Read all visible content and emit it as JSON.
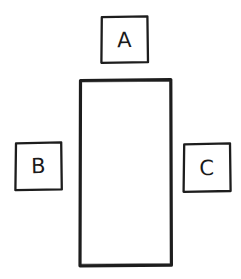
{
  "diagram": {
    "style": "hand-drawn-sketch",
    "background_color": "#ffffff",
    "ink_color": "#1a1a1a",
    "canvas": {
      "width": 241,
      "height": 279
    },
    "shapes": [
      {
        "id": "main-container",
        "name": "main-rectangle",
        "label": "",
        "kind": "rectangle",
        "x": 79,
        "y": 79,
        "width": 93,
        "height": 187,
        "stroke_width": 3,
        "fill": "#ffffff",
        "stroke": "#1a1a1a"
      },
      {
        "id": "box-a",
        "name": "box-a",
        "label": "A",
        "kind": "square",
        "position": "top",
        "x": 101,
        "y": 16,
        "width": 47,
        "height": 47,
        "stroke_width": 2,
        "fill": "#ffffff",
        "stroke": "#1a1a1a"
      },
      {
        "id": "box-b",
        "name": "box-b",
        "label": "B",
        "kind": "square",
        "position": "left",
        "x": 15,
        "y": 142,
        "width": 47,
        "height": 48,
        "stroke_width": 2,
        "fill": "#ffffff",
        "stroke": "#1a1a1a"
      },
      {
        "id": "box-c",
        "name": "box-c",
        "label": "C",
        "kind": "square",
        "position": "right",
        "x": 183,
        "y": 143,
        "width": 48,
        "height": 49,
        "stroke_width": 2,
        "fill": "#ffffff",
        "stroke": "#1a1a1a"
      }
    ]
  }
}
